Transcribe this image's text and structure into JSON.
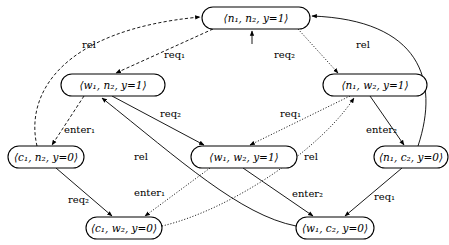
{
  "diagram": {
    "nodes": [
      {
        "id": "n1n2",
        "label": "⟨n₁, n₂, y=1⟩",
        "x": 202,
        "y": 7,
        "w": 108,
        "h": 22
      },
      {
        "id": "w1n2",
        "label": "⟨w₁, n₂, y=1⟩",
        "x": 61,
        "y": 74,
        "w": 104,
        "h": 22
      },
      {
        "id": "n1w2",
        "label": "⟨n₁, w₂, y=1⟩",
        "x": 323,
        "y": 74,
        "w": 104,
        "h": 22
      },
      {
        "id": "c1n2",
        "label": "⟨c₁, n₂, y=0⟩",
        "x": 8,
        "y": 146,
        "w": 76,
        "h": 22
      },
      {
        "id": "w1w2",
        "label": "⟨w₁, w₂, y=1⟩",
        "x": 191,
        "y": 146,
        "w": 106,
        "h": 22
      },
      {
        "id": "n1c2",
        "label": "⟨n₁, c₂, y=0⟩",
        "x": 374,
        "y": 146,
        "w": 74,
        "h": 22
      },
      {
        "id": "c1w2",
        "label": "⟨c₁, w₂, y=0⟩",
        "x": 86,
        "y": 217,
        "w": 76,
        "h": 22
      },
      {
        "id": "w1c2",
        "label": "⟨w₁, c₂, y=0⟩",
        "x": 296,
        "y": 217,
        "w": 78,
        "h": 22
      }
    ],
    "edges": [
      {
        "from": "initial",
        "to": "n1n2",
        "label": "",
        "style": "solid"
      },
      {
        "from": "n1n2",
        "to": "w1n2",
        "label": "req₁",
        "style": "dashed"
      },
      {
        "from": "n1n2",
        "to": "n1w2",
        "label": "req₂",
        "style": "dotted"
      },
      {
        "from": "c1n2",
        "to": "n1n2",
        "label": "rel",
        "style": "dashed"
      },
      {
        "from": "n1c2",
        "to": "n1n2",
        "label": "rel",
        "style": "solid"
      },
      {
        "from": "w1n2",
        "to": "c1n2",
        "label": "enter₁",
        "style": "dashed"
      },
      {
        "from": "w1n2",
        "to": "w1w2",
        "label": "req₂",
        "style": "solid"
      },
      {
        "from": "w1c2",
        "to": "w1n2",
        "label": "rel",
        "style": "solid"
      },
      {
        "from": "n1w2",
        "to": "w1w2",
        "label": "req₁",
        "style": "dotted"
      },
      {
        "from": "n1w2",
        "to": "n1c2",
        "label": "enter₂",
        "style": "solid"
      },
      {
        "from": "c1w2",
        "to": "n1w2",
        "label": "rel",
        "style": "dotted"
      },
      {
        "from": "c1n2",
        "to": "c1w2",
        "label": "req₂",
        "style": "solid"
      },
      {
        "from": "w1w2",
        "to": "c1w2",
        "label": "enter₁",
        "style": "dotted"
      },
      {
        "from": "w1w2",
        "to": "w1c2",
        "label": "enter₂",
        "style": "solid"
      },
      {
        "from": "n1c2",
        "to": "w1c2",
        "label": "req₁",
        "style": "solid"
      }
    ],
    "labels": {
      "rel_top_left": "rel",
      "rel_top_right": "rel",
      "req1_top": "req₁",
      "req2_top": "req₂",
      "enter1_left": "enter₁",
      "req2_mid": "req₂",
      "req1_mid": "req₁",
      "enter2_right": "enter₂",
      "rel_left_mid": "rel",
      "rel_center": "rel",
      "req2_bottom_left": "req₂",
      "enter1_bottom": "enter₁",
      "enter2_bottom": "enter₂",
      "req1_bottom_right": "req₁"
    }
  }
}
